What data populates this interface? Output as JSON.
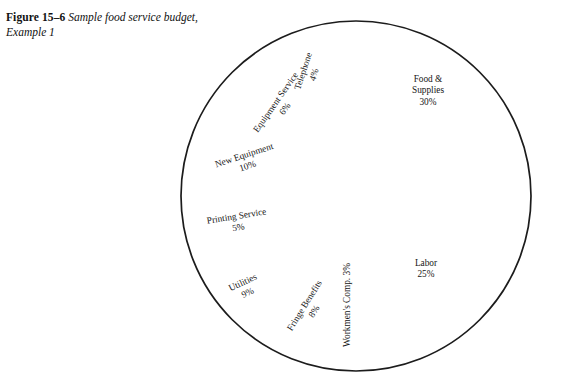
{
  "figure": {
    "label": "Figure 15–6",
    "caption": "Sample food service budget, Example 1"
  },
  "colors": {
    "background": "#ffffff",
    "outline": "#1c1c1c",
    "divider": "#555555",
    "text": "#161616"
  },
  "chart_data": {
    "type": "pie",
    "title": "Sample food service budget, Example 1",
    "legend": "none",
    "start_angle_deg": 0,
    "direction": "clockwise",
    "categories": [
      "Food & Supplies",
      "Labor",
      "Workmen's Comp.",
      "Fringe Benefits",
      "Utilities",
      "Printing Service",
      "New Equipment",
      "Equipment Service",
      "Telephone"
    ],
    "values": [
      30,
      25,
      3,
      8,
      9,
      5,
      10,
      6,
      4
    ],
    "unit": "%",
    "total": 100,
    "slices": [
      {
        "name": "Food & Supplies",
        "value": 30,
        "label_lines": [
          "Food &",
          "Supplies",
          "30%"
        ],
        "pct_text": "30%",
        "rotation_deg": 0,
        "label_x": 428,
        "label_y": 82,
        "anchor": "middle"
      },
      {
        "name": "Labor",
        "value": 25,
        "label_lines": [
          "Labor",
          "25%"
        ],
        "pct_text": "25%",
        "rotation_deg": 0,
        "label_x": 426,
        "label_y": 266,
        "anchor": "middle"
      },
      {
        "name": "Workmen's Comp.",
        "value": 3,
        "label_lines": [
          "Workmen's Comp. 3%"
        ],
        "pct_text": "3%",
        "rotation_deg": -90,
        "label_x": 350,
        "label_y": 305,
        "anchor": "middle"
      },
      {
        "name": "Fringe Benefits",
        "value": 8,
        "label_lines": [
          "Fringe Benefits",
          "8%"
        ],
        "pct_text": "8%",
        "rotation_deg": -58,
        "label_x": 307,
        "label_y": 307,
        "anchor": "middle"
      },
      {
        "name": "Utilities",
        "value": 9,
        "label_lines": [
          "Utilities",
          "9%"
        ],
        "pct_text": "9%",
        "rotation_deg": -25,
        "label_x": 244,
        "label_y": 285,
        "anchor": "middle"
      },
      {
        "name": "Printing Service",
        "value": 5,
        "label_lines": [
          "Printing Service",
          "5%"
        ],
        "pct_text": "5%",
        "rotation_deg": -9,
        "label_x": 237,
        "label_y": 219,
        "anchor": "middle"
      },
      {
        "name": "New Equipment",
        "value": 10,
        "label_lines": [
          "New Equipment",
          "10%"
        ],
        "pct_text": "10%",
        "rotation_deg": -18,
        "label_x": 245,
        "label_y": 158,
        "anchor": "middle"
      },
      {
        "name": "Equipment Service",
        "value": 6,
        "label_lines": [
          "Equipment Service",
          "6%"
        ],
        "pct_text": "6%",
        "rotation_deg": -55,
        "label_x": 278,
        "label_y": 104,
        "anchor": "middle"
      },
      {
        "name": "Telephone",
        "value": 4,
        "label_lines": [
          "Telephone",
          "4%"
        ],
        "pct_text": "4%",
        "rotation_deg": -72,
        "label_x": 306,
        "label_y": 72,
        "anchor": "middle"
      }
    ],
    "geometry": {
      "center_x": 356,
      "center_y": 196,
      "radius": 175
    }
  }
}
